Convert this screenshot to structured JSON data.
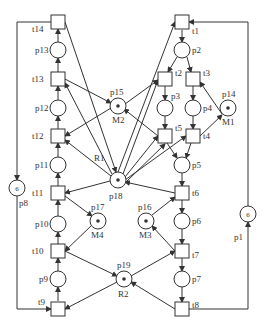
{
  "diagram": {
    "type": "petri-net",
    "colors": {
      "stroke": "#333333",
      "background": "#ffffff"
    },
    "transitions": [
      {
        "id": "t1",
        "label": "t1",
        "x": 182,
        "y": 22,
        "lx": 192,
        "ly": 34
      },
      {
        "id": "t2",
        "label": "t2",
        "x": 165,
        "y": 79,
        "lx": 175,
        "ly": 76
      },
      {
        "id": "t3",
        "label": "t3",
        "x": 193,
        "y": 79,
        "lx": 203,
        "ly": 76
      },
      {
        "id": "t4",
        "label": "t4",
        "x": 193,
        "y": 136,
        "lx": 203,
        "ly": 139
      },
      {
        "id": "t5",
        "label": "t5",
        "x": 165,
        "y": 136,
        "lx": 175,
        "ly": 131
      },
      {
        "id": "t6",
        "label": "t6",
        "x": 182,
        "y": 193,
        "lx": 192,
        "ly": 196
      },
      {
        "id": "t7",
        "label": "t7",
        "x": 182,
        "y": 251,
        "lx": 192,
        "ly": 258
      },
      {
        "id": "t8",
        "label": "t8",
        "x": 182,
        "y": 309,
        "lx": 192,
        "ly": 308
      },
      {
        "id": "t9",
        "label": "t9",
        "x": 58,
        "y": 309,
        "lx": 38,
        "ly": 305
      },
      {
        "id": "t10",
        "label": "t10",
        "x": 58,
        "y": 251,
        "lx": 32,
        "ly": 254
      },
      {
        "id": "t11",
        "label": "t11",
        "x": 58,
        "y": 193,
        "lx": 32,
        "ly": 196
      },
      {
        "id": "t12",
        "label": "t12",
        "x": 58,
        "y": 136,
        "lx": 32,
        "ly": 139
      },
      {
        "id": "t13",
        "label": "t13",
        "x": 58,
        "y": 79,
        "lx": 32,
        "ly": 82
      },
      {
        "id": "t14",
        "label": "t14",
        "x": 58,
        "y": 22,
        "lx": 32,
        "ly": 32
      }
    ],
    "places": [
      {
        "id": "p1",
        "label": "p1",
        "x": 248,
        "y": 214,
        "tokens": "6",
        "lx": 234,
        "ly": 240
      },
      {
        "id": "p2",
        "label": "p2",
        "x": 182,
        "y": 50,
        "tokens": "",
        "lx": 192,
        "ly": 53
      },
      {
        "id": "p3",
        "label": "p3",
        "x": 165,
        "y": 108,
        "tokens": "",
        "lx": 171,
        "ly": 99
      },
      {
        "id": "p4",
        "label": "p4",
        "x": 193,
        "y": 108,
        "tokens": "",
        "lx": 203,
        "ly": 111
      },
      {
        "id": "p5",
        "label": "p5",
        "x": 182,
        "y": 165,
        "tokens": "",
        "lx": 192,
        "ly": 168
      },
      {
        "id": "p6",
        "label": "p6",
        "x": 182,
        "y": 221,
        "tokens": "",
        "lx": 192,
        "ly": 224
      },
      {
        "id": "p7",
        "label": "p7",
        "x": 182,
        "y": 279,
        "lx": 192,
        "ly": 282,
        "tokens": ""
      },
      {
        "id": "p8",
        "label": "p8",
        "x": 17,
        "y": 188,
        "tokens": "6",
        "lx": 19,
        "ly": 206
      },
      {
        "id": "p9",
        "label": "p9",
        "x": 58,
        "y": 279,
        "tokens": "",
        "lx": 39,
        "ly": 282
      },
      {
        "id": "p10",
        "label": "p10",
        "x": 58,
        "y": 224,
        "tokens": "",
        "lx": 35,
        "ly": 227
      },
      {
        "id": "p11",
        "label": "p11",
        "x": 58,
        "y": 165,
        "tokens": "",
        "lx": 35,
        "ly": 168
      },
      {
        "id": "p12",
        "label": "p12",
        "x": 58,
        "y": 108,
        "tokens": "",
        "lx": 35,
        "ly": 111
      },
      {
        "id": "p13",
        "label": "p13",
        "x": 58,
        "y": 50,
        "tokens": "",
        "lx": 35,
        "ly": 53
      },
      {
        "id": "p14",
        "label": "p14",
        "x": 228,
        "y": 108,
        "tokens": "•",
        "lx": 222,
        "ly": 97,
        "name": "M1",
        "nx": 222,
        "ny": 125
      },
      {
        "id": "p15",
        "label": "p15",
        "x": 118,
        "y": 106,
        "tokens": "•",
        "lx": 110,
        "ly": 95,
        "name": "M2",
        "nx": 112,
        "ny": 123
      },
      {
        "id": "p16",
        "label": "p16",
        "x": 146,
        "y": 221,
        "tokens": "•",
        "lx": 138,
        "ly": 210,
        "name": "M3",
        "nx": 139,
        "ny": 238
      },
      {
        "id": "p17",
        "label": "p17",
        "x": 98,
        "y": 221,
        "tokens": "•",
        "lx": 91,
        "ly": 210,
        "name": "M4",
        "nx": 91,
        "ny": 238
      },
      {
        "id": "p18",
        "label": "p18",
        "x": 118,
        "y": 180,
        "tokens": "•",
        "lx": 109,
        "ly": 199,
        "name": "R1",
        "nx": 94,
        "ny": 161
      },
      {
        "id": "p19",
        "label": "p19",
        "x": 124,
        "y": 279,
        "tokens": "•",
        "lx": 117,
        "ly": 268,
        "name": "R2",
        "nx": 118,
        "ny": 297
      }
    ],
    "arcs": [
      {
        "d": "M182,30 L182,42"
      },
      {
        "d": "M177,57 L168,72"
      },
      {
        "d": "M187,57 L191,72"
      },
      {
        "d": "M165,86 L165,100"
      },
      {
        "d": "M193,86 L193,100"
      },
      {
        "d": "M165,116 L165,129"
      },
      {
        "d": "M193,116 L193,129"
      },
      {
        "d": "M167,143 L177,158"
      },
      {
        "d": "M191,143 L186,158"
      },
      {
        "d": "M182,173 L182,186"
      },
      {
        "d": "M182,200 L182,213"
      },
      {
        "d": "M182,229 L182,244"
      },
      {
        "d": "M182,258 L182,271"
      },
      {
        "d": "M182,287 L182,302"
      },
      {
        "d": "M189,309 L248,309 L248,222"
      },
      {
        "d": "M248,206 L248,22 L189,22"
      },
      {
        "d": "M58,301 L58,287"
      },
      {
        "d": "M58,271 L58,258"
      },
      {
        "d": "M58,244 L58,232"
      },
      {
        "d": "M58,216 L58,200"
      },
      {
        "d": "M58,186 L58,173"
      },
      {
        "d": "M58,157 L58,143"
      },
      {
        "d": "M58,129 L58,116"
      },
      {
        "d": "M58,100 L58,86"
      },
      {
        "d": "M58,72 L58,58"
      },
      {
        "d": "M58,42 L58,29"
      },
      {
        "d": "M51,22 L17,22 L17,180"
      },
      {
        "d": "M17,196 L17,309 L51,309"
      },
      {
        "d": "M200,136 L222,115"
      },
      {
        "d": "M222,114 L200,82"
      },
      {
        "d": "M65,79 L111,103"
      },
      {
        "d": "M111,108 L65,136"
      },
      {
        "d": "M125,104 L158,80"
      },
      {
        "d": "M158,136 L124,109"
      },
      {
        "d": "M110,181 L65,193"
      },
      {
        "d": "M65,22 L116,172"
      },
      {
        "d": "M112,174 L65,83"
      },
      {
        "d": "M111,176 L65,140"
      },
      {
        "d": "M118,172 L175,22"
      },
      {
        "d": "M123,174 L158,80"
      },
      {
        "d": "M125,177 L158,136"
      },
      {
        "d": "M125,180 L186,136"
      },
      {
        "d": "M126,182 L165,144"
      },
      {
        "d": "M175,193 L125,182"
      },
      {
        "d": "M65,196 L92,216"
      },
      {
        "d": "M92,225 L65,251"
      },
      {
        "d": "M152,215 L175,197"
      },
      {
        "d": "M175,251 L152,226"
      },
      {
        "d": "M65,251 L117,276"
      },
      {
        "d": "M117,282 L65,309"
      },
      {
        "d": "M131,276 L175,251"
      },
      {
        "d": "M175,309 L131,282"
      }
    ]
  }
}
